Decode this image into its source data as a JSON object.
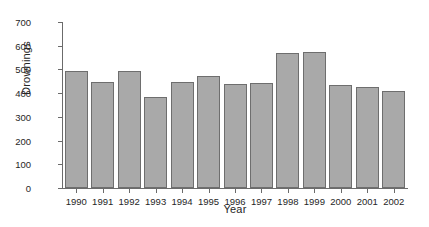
{
  "chart_data": {
    "type": "bar",
    "title": "",
    "xlabel": "Year",
    "ylabel": "Drownings",
    "categories": [
      "1990",
      "1991",
      "1992",
      "1993",
      "1994",
      "1995",
      "1996",
      "1997",
      "1998",
      "1999",
      "2000",
      "2001",
      "2002"
    ],
    "values": [
      495,
      448,
      495,
      385,
      448,
      472,
      440,
      442,
      570,
      572,
      435,
      424,
      410
    ],
    "series": [
      {
        "name": "Drownings",
        "values": [
          495,
          448,
          495,
          385,
          448,
          472,
          440,
          442,
          570,
          572,
          435,
          424,
          410
        ]
      }
    ],
    "ylim": [
      0,
      700
    ],
    "yticks": [
      0,
      100,
      200,
      300,
      400,
      500,
      600,
      700
    ],
    "ytick_labels": [
      "0",
      "100",
      "200",
      "300",
      "400",
      "500",
      "600",
      "700"
    ],
    "grid": false,
    "legend": null,
    "legend_position": "none",
    "bar_fill_color": "#a9a9a9",
    "bar_edge_color": "#6e6e6e",
    "axis_color": "#6b6b6b",
    "background_color": "#ffffff"
  }
}
